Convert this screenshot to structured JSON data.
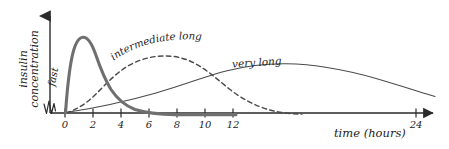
{
  "figure": {
    "kind": "line-chart",
    "background": "#ffffff",
    "ink": "#1d1d1d"
  },
  "axes": {
    "y_label_line1": "insulin",
    "y_label_line2": "concentration",
    "x_label": "time (hours)",
    "x_ticks": [
      {
        "value": 0,
        "label": "0"
      },
      {
        "value": 2,
        "label": "2"
      },
      {
        "value": 4,
        "label": "4"
      },
      {
        "value": 6,
        "label": "6"
      },
      {
        "value": 8,
        "label": "8"
      },
      {
        "value": 10,
        "label": "10"
      },
      {
        "value": 12,
        "label": "12"
      },
      {
        "value": 24,
        "label": "24"
      }
    ],
    "has_axis_break": true,
    "x_arrow": true,
    "y_arrow": true
  },
  "annotations": {
    "fast": "fast",
    "intermediate_long": "intermediate long",
    "very_long": "very long"
  },
  "colors": {
    "fast_curve": "#6f6f6f",
    "intermediate_curve": "#4a4a4a",
    "very_long_curve": "#4a4a4a",
    "axis": "#2a2a2a"
  },
  "chart_data": {
    "type": "line",
    "title": "",
    "xlabel": "time (hours)",
    "ylabel": "insulin concentration",
    "xlim": [
      0,
      26
    ],
    "ylim": [
      0,
      1.05
    ],
    "grid": false,
    "legend": "inline-annotations",
    "x_tick_values": [
      0,
      2,
      4,
      6,
      8,
      10,
      12,
      24
    ],
    "x_tick_labels": [
      "0",
      "2",
      "4",
      "6",
      "8",
      "10",
      "12",
      "24"
    ],
    "series": [
      {
        "name": "fast",
        "style": "solid-thick",
        "color": "#6f6f6f",
        "peak_time_hours": 1.1,
        "peak_value": 1.0,
        "onset_hours": 0.2,
        "duration_hours": 8,
        "x": [
          0.0,
          0.2,
          0.4,
          0.6,
          0.8,
          1.0,
          1.2,
          1.5,
          2.0,
          2.5,
          3.0,
          3.5,
          4.0,
          4.5,
          5.0,
          5.5,
          6.0,
          6.5,
          7.0,
          7.5,
          8.0,
          9.0,
          10.0,
          11.0,
          12.0,
          13.0
        ],
        "y": [
          0.0,
          0.02,
          0.3,
          0.66,
          0.9,
          0.99,
          1.0,
          0.95,
          0.8,
          0.65,
          0.52,
          0.41,
          0.32,
          0.24,
          0.18,
          0.13,
          0.095,
          0.068,
          0.048,
          0.034,
          0.024,
          0.013,
          0.008,
          0.005,
          0.003,
          0.002
        ]
      },
      {
        "name": "intermediate long",
        "style": "dashed",
        "color": "#4a4a4a",
        "peak_time_hours": 5.5,
        "peak_value": 0.62,
        "onset_hours": 0.3,
        "duration_hours": 18,
        "x": [
          0.0,
          0.5,
          1.0,
          1.5,
          2.0,
          2.5,
          3.0,
          3.5,
          4.0,
          4.5,
          5.0,
          5.5,
          6.0,
          6.5,
          7.0,
          7.5,
          8.0,
          9.0,
          10.0,
          11.0,
          12.0,
          13.0,
          14.0,
          15.0,
          16.0,
          17.0,
          18.0
        ],
        "y": [
          0.0,
          0.05,
          0.12,
          0.2,
          0.29,
          0.38,
          0.46,
          0.53,
          0.58,
          0.61,
          0.62,
          0.62,
          0.61,
          0.59,
          0.56,
          0.52,
          0.47,
          0.38,
          0.29,
          0.21,
          0.15,
          0.1,
          0.065,
          0.04,
          0.025,
          0.012,
          0.004
        ]
      },
      {
        "name": "very long",
        "style": "solid-thin",
        "color": "#4a4a4a",
        "peak_time_hours": 13.5,
        "peak_value": 0.42,
        "onset_hours": 0.4,
        "duration_hours": 26,
        "x": [
          0.0,
          1.0,
          2.0,
          3.0,
          4.0,
          5.0,
          6.0,
          7.0,
          8.0,
          9.0,
          10.0,
          11.0,
          12.0,
          13.0,
          14.0,
          15.0,
          16.0,
          17.0,
          18.0,
          19.0,
          20.0,
          21.0,
          22.0,
          23.0,
          24.0,
          25.0,
          26.0
        ],
        "y": [
          0.0,
          0.035,
          0.07,
          0.105,
          0.14,
          0.175,
          0.215,
          0.255,
          0.295,
          0.335,
          0.37,
          0.395,
          0.412,
          0.42,
          0.421,
          0.415,
          0.4,
          0.382,
          0.36,
          0.335,
          0.31,
          0.285,
          0.26,
          0.235,
          0.21,
          0.185,
          0.165
        ]
      }
    ]
  }
}
